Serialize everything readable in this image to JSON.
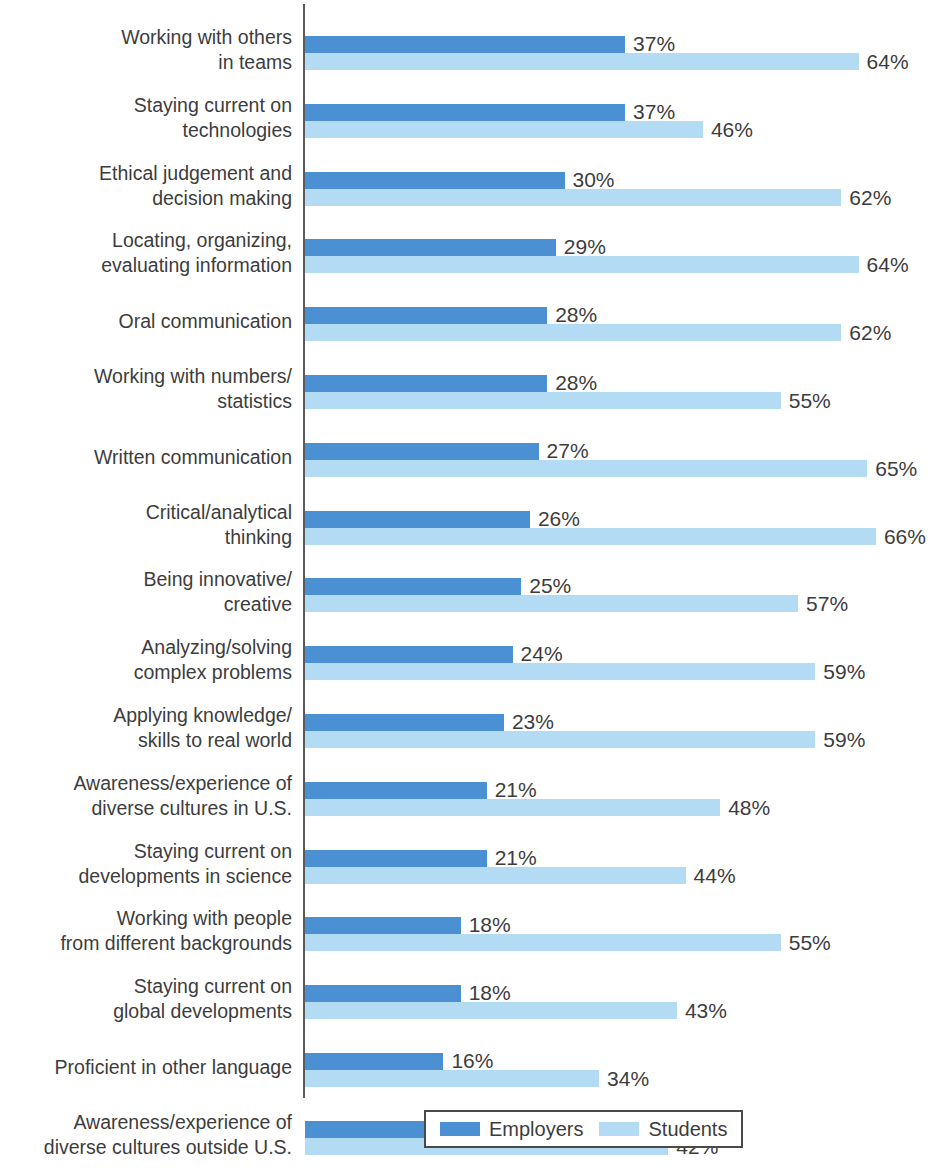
{
  "chart_data": {
    "type": "bar",
    "orientation": "horizontal",
    "title": "",
    "xlabel": "",
    "ylabel": "",
    "xlim": [
      0,
      72
    ],
    "grid": false,
    "legend_position": "bottom",
    "value_suffix": "%",
    "categories": [
      "Working with others\nin teams",
      "Staying current on\ntechnologies",
      "Ethical judgement and\ndecision making",
      "Locating, organizing,\nevaluating information",
      "Oral communication",
      "Working with numbers/\nstatistics",
      "Written communication",
      "Critical/analytical\nthinking",
      "Being innovative/\ncreative",
      "Analyzing/solving\ncomplex problems",
      "Applying knowledge/\nskills to real world",
      "Awareness/experience of\ndiverse cultures in U.S.",
      "Staying current on\ndevelopments in science",
      "Working with people\nfrom different backgrounds",
      "Staying current on\nglobal developments",
      "Proficient in other language",
      "Awareness/experience of\ndiverse cultures outside U.S."
    ],
    "series": [
      {
        "name": "Employers",
        "color": "#4a90d2",
        "values": [
          37,
          37,
          30,
          29,
          28,
          28,
          27,
          26,
          25,
          24,
          23,
          21,
          21,
          18,
          18,
          16,
          15
        ],
        "labels": [
          "37%",
          "37%",
          "30%",
          "29%",
          "28%",
          "28%",
          "27%",
          "26%",
          "25%",
          "24%",
          "23%",
          "21%",
          "21%",
          "18%",
          "18%",
          "16%",
          "15%"
        ]
      },
      {
        "name": "Students",
        "color": "#b3dbf4",
        "values": [
          64,
          46,
          62,
          64,
          62,
          55,
          65,
          66,
          57,
          59,
          59,
          48,
          44,
          55,
          43,
          34,
          42
        ],
        "labels": [
          "64%",
          "46%",
          "62%",
          "64%",
          "62%",
          "55%",
          "65%",
          "66%",
          "57%",
          "59%",
          "59%",
          "48%",
          "44%",
          "55%",
          "43%",
          "34%",
          "42%"
        ]
      }
    ]
  },
  "legend": {
    "items": [
      {
        "label": "Employers",
        "swatch": "employers"
      },
      {
        "label": "Students",
        "swatch": "students"
      }
    ]
  },
  "title_sliver": " "
}
